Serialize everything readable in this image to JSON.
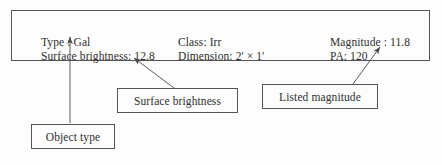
{
  "panel": {
    "name": "object-info-panel",
    "columns": [
      {
        "fields": [
          {
            "label": "Type : Gal"
          },
          {
            "label": "Surface brightness: 12.8"
          }
        ]
      },
      {
        "fields": [
          {
            "label": "Class: Irr"
          },
          {
            "label": "Dimension: 2' × 1'"
          }
        ]
      },
      {
        "fields": [
          {
            "label": "Magnitude : 11.8"
          },
          {
            "label": "PA: 120"
          }
        ]
      }
    ]
  },
  "callouts": [
    {
      "id": "surface-brightness",
      "label": "Surface brightness"
    },
    {
      "id": "listed-magnitude",
      "label": "Listed magnitude"
    },
    {
      "id": "object-type",
      "label": "Object type"
    }
  ],
  "colors": {
    "stroke": "#555555",
    "text": "#2f2f2f",
    "background": "#fdfdfd"
  }
}
